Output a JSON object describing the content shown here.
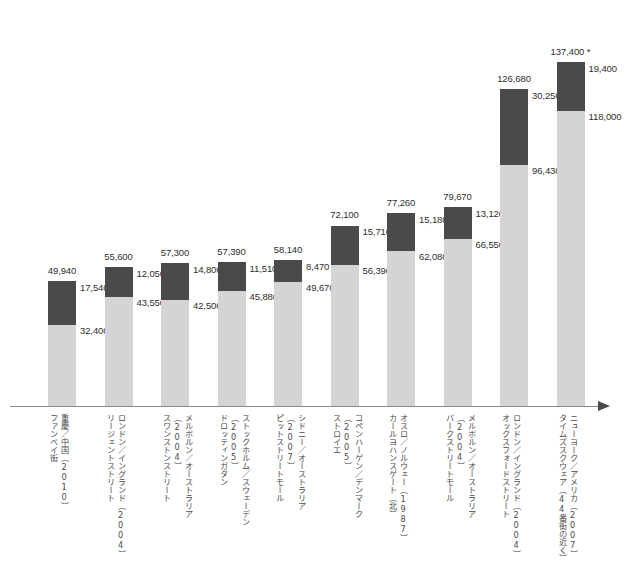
{
  "chart_data": {
    "type": "bar",
    "subtype": "stacked-vertical",
    "title": "",
    "subtitle": "",
    "xlabel": "",
    "ylabel": "",
    "ylim": [
      0,
      137400
    ],
    "grid": false,
    "legend_position": "none",
    "axis": {
      "baseline": true,
      "arrow_right": true
    },
    "note": "137,400 *",
    "series": [
      {
        "name": "lower-segment",
        "color": "#d4d4d4",
        "values": [
          32400,
          43550,
          42500,
          45880,
          49670,
          56390,
          62080,
          66550,
          96430,
          118000
        ]
      },
      {
        "name": "upper-segment",
        "color": "#4a4a4a",
        "values": [
          17540,
          12050,
          14800,
          11510,
          8470,
          15710,
          15180,
          13120,
          30250,
          19400
        ]
      }
    ],
    "totals": [
      "49,940",
      "55,600",
      "57,300",
      "57,390",
      "58,140",
      "72,100",
      "77,260",
      "79,670",
      "126,680",
      "137,400 *"
    ],
    "upper_labels": [
      "17,540",
      "12,050",
      "14,800",
      "11,510",
      "8,470",
      "15,710",
      "15,180",
      "13,120",
      "30,250",
      "19,400"
    ],
    "lower_labels": [
      "32,400",
      "43,550",
      "42,500",
      "45,880",
      "49,670",
      "56,390",
      "62,080",
      "66,550",
      "96,430",
      "118,000"
    ],
    "categories": [
      "重慶／中国（2010）\nファンベイ街",
      "ロンドン／イングランド（2004）\nリージェントストリート",
      "メルボルン／オーストラリア（2004）\nスワンストンストリート",
      "ストックホルム／スウェーデン（2005）\nドロッティンガタン",
      "シドニー／オーストラリア（2007）\nピットストリートモール",
      "コペンハーゲン／デンマーク（2005）\nストロイエ",
      "オスロ／ノルウェー（1987）\nカールヨハンスゲート（北）",
      "メルボルン／オーストラリア（2004）\nバークストリートモール",
      "ロンドン／イングランド（2004）\nオックスフォードストリート",
      "ニューヨーク／アメリカ（2007）\nタイムズスクウェア（44番街の近く）"
    ],
    "bars": [
      {
        "total": "49,940",
        "upper": "17,540",
        "lower": "32,400",
        "total_v": 49940,
        "upper_v": 17540,
        "lower_v": 32400,
        "category": "重慶／中国（2010）\nファンベイ街"
      },
      {
        "total": "55,600",
        "upper": "12,050",
        "lower": "43,550",
        "total_v": 55600,
        "upper_v": 12050,
        "lower_v": 43550,
        "category": "ロンドン／イングランド（2004）\nリージェントストリート"
      },
      {
        "total": "57,300",
        "upper": "14,800",
        "lower": "42,500",
        "total_v": 57300,
        "upper_v": 14800,
        "lower_v": 42500,
        "category": "メルボルン／オーストラリア（2004）\nスワンストンストリート"
      },
      {
        "total": "57,390",
        "upper": "11,510",
        "lower": "45,880",
        "total_v": 57390,
        "upper_v": 11510,
        "lower_v": 45880,
        "category": "ストックホルム／スウェーデン（2005）\nドロッティンガタン"
      },
      {
        "total": "58,140",
        "upper": "8,470",
        "lower": "49,670",
        "total_v": 58140,
        "upper_v": 8470,
        "lower_v": 49670,
        "category": "シドニー／オーストラリア（2007）\nピットストリートモール"
      },
      {
        "total": "72,100",
        "upper": "15,710",
        "lower": "56,390",
        "total_v": 72100,
        "upper_v": 15710,
        "lower_v": 56390,
        "category": "コペンハーゲン／デンマーク（2005）\nストロイエ"
      },
      {
        "total": "77,260",
        "upper": "15,180",
        "lower": "62,080",
        "total_v": 77260,
        "upper_v": 15180,
        "lower_v": 62080,
        "category": "オスロ／ノルウェー（1987）\nカールヨハンスゲート（北）"
      },
      {
        "total": "79,670",
        "upper": "13,120",
        "lower": "66,550",
        "total_v": 79670,
        "upper_v": 13120,
        "lower_v": 66550,
        "category": "メルボルン／オーストラリア（2004）\nバークストリートモール"
      },
      {
        "total": "126,680",
        "upper": "30,250",
        "lower": "96,430",
        "total_v": 126680,
        "upper_v": 30250,
        "lower_v": 96430,
        "category": "ロンドン／イングランド（2004）\nオックスフォードストリート"
      },
      {
        "total": "137,400 *",
        "upper": "19,400",
        "lower": "118,000",
        "total_v": 137400,
        "upper_v": 19400,
        "lower_v": 118000,
        "category": "ニューヨーク／アメリカ（2007）\nタイムズスクウェア（44番街の近く）"
      }
    ]
  },
  "colors": {
    "upper_segment": "#4a4a4a",
    "lower_segment": "#d4d4d4",
    "axis": "#8a8a8a",
    "text": "#2e2e2e",
    "background": "#ffffff"
  }
}
